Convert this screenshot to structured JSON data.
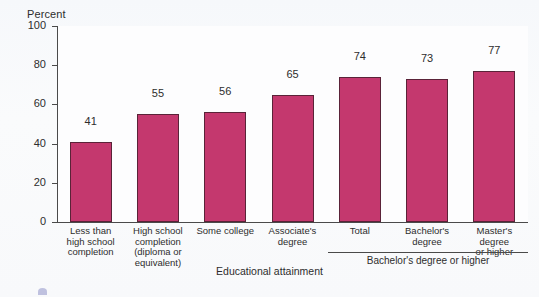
{
  "chart_data": {
    "type": "bar",
    "title": "",
    "xlabel": "Educational attainment",
    "ylabel": "Percent",
    "ylim": [
      0,
      100
    ],
    "yticks": [
      0,
      20,
      40,
      60,
      80,
      100
    ],
    "grid": false,
    "legend": null,
    "categories": [
      "Less than high school completion",
      "High school completion (diploma or equivalent)",
      "Some college",
      "Associate's degree",
      "Total",
      "Bachelor's degree",
      "Master's degree or higher"
    ],
    "category_lines": [
      [
        "Less than",
        "high school",
        "completion"
      ],
      [
        "High school",
        "completion",
        "(diploma or",
        "equivalent)"
      ],
      [
        "Some college"
      ],
      [
        "Associate's",
        "degree"
      ],
      [
        "Total"
      ],
      [
        "Bachelor's",
        "degree"
      ],
      [
        "Master's degree",
        "or higher"
      ]
    ],
    "values": [
      41,
      55,
      56,
      65,
      74,
      73,
      77
    ],
    "bar_color": "#c4386e",
    "bar_edge_color": "#5a2338",
    "annotations": [
      {
        "text": "Bachelor's degree or higher",
        "spans_categories": [
          "Total",
          "Bachelor's degree",
          "Master's degree or higher"
        ]
      }
    ]
  },
  "axis": {
    "y_title": "Percent",
    "x_title": "Educational attainment",
    "y_tick_labels": [
      "100",
      "80",
      "60",
      "40",
      "20",
      "0"
    ]
  },
  "group_bracket": {
    "label": "Bachelor's degree or higher"
  }
}
